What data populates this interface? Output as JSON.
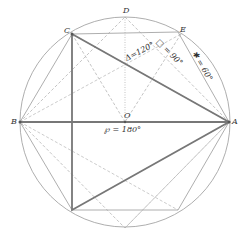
{
  "diagram": {
    "type": "inscribed polygons in circle with chord angle labels",
    "center": {
      "name": "O",
      "x": 125,
      "y": 122
    },
    "radius": 105,
    "points": [
      {
        "name": "A",
        "x": 229,
        "y": 122
      },
      {
        "name": "B",
        "x": 20,
        "y": 122
      },
      {
        "name": "C",
        "x": 72,
        "y": 34
      },
      {
        "name": "D",
        "x": 125,
        "y": 17
      },
      {
        "name": "E",
        "x": 181,
        "y": 35
      },
      {
        "name": "O",
        "x": 125,
        "y": 122
      }
    ],
    "angle_labels": [
      {
        "id": "triangle",
        "text": "Δ=120°"
      },
      {
        "id": "square",
        "text": "□ = 90°"
      },
      {
        "id": "hexagon",
        "text": "✱ = 60°"
      },
      {
        "id": "diameter",
        "text": "℘ = 180°"
      }
    ],
    "colors": {
      "stroke": "#888888",
      "heavy": "#777777",
      "text": "#333333",
      "background": "#ffffff"
    }
  }
}
